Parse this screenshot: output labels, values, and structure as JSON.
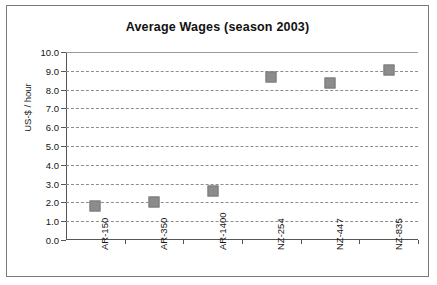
{
  "chart_data": {
    "type": "scatter",
    "title": "Average Wages (season 2003)",
    "xlabel": "",
    "ylabel": "US-$ / hour",
    "categories": [
      "AR-150",
      "AR-350",
      "AR-1400",
      "NZ-254",
      "NZ-447",
      "NZ-835"
    ],
    "values": [
      1.8,
      2.0,
      2.6,
      8.65,
      8.35,
      9.05
    ],
    "ylim": [
      0.0,
      10.0
    ],
    "ytick_step": 1.0,
    "ytick_labels": [
      "0.0",
      "1.0",
      "2.0",
      "3.0",
      "4.0",
      "5.0",
      "6.0",
      "7.0",
      "8.0",
      "9.0",
      "10.0"
    ],
    "grid": "horizontal-dashed",
    "legend": "none",
    "marker_color": "#8c8c8c",
    "marker_shape": "square"
  }
}
